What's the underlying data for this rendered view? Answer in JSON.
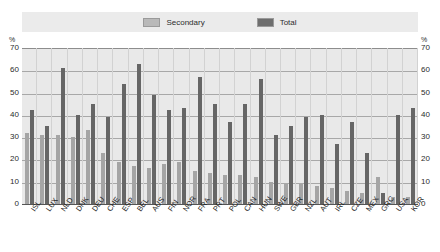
{
  "legend": {
    "items": [
      {
        "label": "Secondary",
        "color": "#b9b9b9",
        "icon": "legend-swatch-icon"
      },
      {
        "label": "Total",
        "color": "#6e6e6e",
        "icon": "legend-swatch-icon"
      }
    ]
  },
  "axis": {
    "unit_left": "%",
    "unit_right": "%",
    "ticks": [
      "70",
      "60",
      "50",
      "40",
      "30",
      "20",
      "10",
      "0"
    ]
  },
  "chart_data": {
    "type": "bar",
    "title": "",
    "subtitle": "",
    "xlabel": "",
    "ylabel": "%",
    "ylim": [
      0,
      70
    ],
    "ytick_step": 10,
    "grid": true,
    "legend_position": "top-center",
    "categories": [
      "ISL",
      "LUX",
      "NLD",
      "DNK",
      "DEU",
      "CHE",
      "ESP",
      "BEL",
      "AUS",
      "FIN",
      "NOR",
      "FRA",
      "PRT",
      "POL",
      "CAN",
      "HUN",
      "SWE",
      "GBR",
      "NZL",
      "AUT",
      "IRL",
      "CZE",
      "MEX",
      "GRC",
      "USA",
      "KOR"
    ],
    "series": [
      {
        "name": "Secondary",
        "color": "#a5a5a5",
        "values": [
          32,
          31,
          31,
          30,
          33,
          23,
          19,
          17,
          16,
          18,
          19,
          15,
          14,
          13,
          13,
          12,
          10,
          9,
          9,
          8,
          7,
          6,
          5,
          12,
          3,
          3
        ]
      },
      {
        "name": "Total",
        "color": "#666666",
        "values": [
          42,
          35,
          61,
          40,
          45,
          39,
          54,
          63,
          49,
          42,
          43,
          57,
          45,
          37,
          45,
          56,
          31,
          35,
          39,
          40,
          27,
          37,
          23,
          5,
          40,
          43
        ]
      }
    ]
  }
}
